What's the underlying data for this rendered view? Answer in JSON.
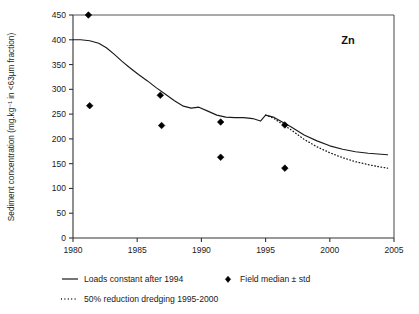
{
  "chart_data": {
    "type": "line",
    "title": "Zn",
    "xlabel": "",
    "ylabel": "Sediment concentration (mg.kg⁻¹ in <63µm fraction)",
    "xlim": [
      1980,
      2005
    ],
    "ylim": [
      0,
      450
    ],
    "xticks": [
      1980,
      1985,
      1990,
      1995,
      2000,
      2005
    ],
    "yticks": [
      0,
      50,
      100,
      150,
      200,
      250,
      300,
      350,
      400,
      450
    ],
    "grid": false,
    "legend_position": "below",
    "series": [
      {
        "name": "Loads constant after 1994",
        "style": "solid",
        "x": [
          1980.0,
          1980.6,
          1981.3,
          1982.0,
          1982.6,
          1983.2,
          1983.8,
          1984.4,
          1985.1,
          1985.8,
          1986.5,
          1987.2,
          1987.9,
          1988.6,
          1989.2,
          1989.8,
          1990.5,
          1991.2,
          1991.9,
          1992.6,
          1993.3,
          1994.0,
          1994.6,
          1995.0,
          1995.6,
          1996.3,
          1997.0,
          1998.0,
          1999.0,
          2000.0,
          2001.0,
          2002.0,
          2003.0,
          2004.0,
          2004.5
        ],
        "y": [
          400,
          400,
          398,
          393,
          384,
          371,
          357,
          344,
          330,
          317,
          303,
          290,
          277,
          266,
          262,
          264,
          256,
          248,
          244,
          243,
          243,
          241,
          236,
          248,
          244,
          234,
          224,
          208,
          196,
          186,
          179,
          174,
          171,
          169,
          168
        ]
      },
      {
        "name": "50% reduction dredging 1995-2000",
        "style": "dotted",
        "x": [
          1995.0,
          1995.6,
          1996.3,
          1997.0,
          1998.0,
          1999.0,
          2000.0,
          2001.0,
          2002.0,
          2003.0,
          2004.0,
          2004.5
        ],
        "y": [
          248,
          242,
          230,
          218,
          199,
          184,
          172,
          162,
          154,
          148,
          143,
          141
        ]
      }
    ],
    "scatter": [
      {
        "name": "Field median ± std",
        "marker": "diamond",
        "points": [
          {
            "x": 1981.2,
            "y": 450
          },
          {
            "x": 1981.3,
            "y": 267
          },
          {
            "x": 1986.8,
            "y": 288
          },
          {
            "x": 1986.9,
            "y": 227
          },
          {
            "x": 1991.5,
            "y": 234
          },
          {
            "x": 1991.5,
            "y": 163
          },
          {
            "x": 1996.5,
            "y": 228
          },
          {
            "x": 1996.5,
            "y": 141
          }
        ]
      }
    ],
    "legend": [
      {
        "label": "Loads constant after 1994",
        "swatch": "solid-line"
      },
      {
        "label": "Field median ± std",
        "swatch": "diamond-marker"
      },
      {
        "label": "50% reduction dredging 1995-2000",
        "swatch": "dotted-line"
      }
    ],
    "colors": {
      "line": "#1a1a1a",
      "marker": "#000000",
      "axis": "#333333",
      "background": "#ffffff"
    }
  }
}
